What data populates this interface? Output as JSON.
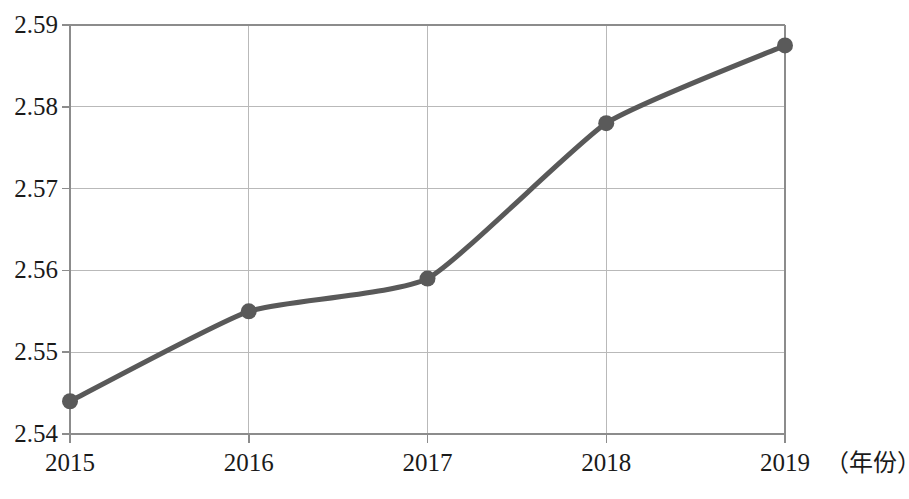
{
  "chart_data": {
    "type": "line",
    "title": "",
    "subtitle": "",
    "xlabel": "（年份）",
    "ylabel": "",
    "categories": [
      "2015",
      "2016",
      "2017",
      "2018",
      "2019"
    ],
    "x": [
      2015,
      2016,
      2017,
      2018,
      2019
    ],
    "values": [
      2.544,
      2.555,
      2.559,
      2.578,
      2.5875
    ],
    "series": [
      {
        "name": "",
        "values": [
          2.544,
          2.555,
          2.559,
          2.578,
          2.5875
        ]
      }
    ],
    "ylim": [
      2.54,
      2.59
    ],
    "xlim": [
      2015,
      2019
    ],
    "yticks": [
      2.54,
      2.55,
      2.56,
      2.57,
      2.58,
      2.59
    ],
    "ytick_labels": [
      "2.54",
      "2.55",
      "2.56",
      "2.57",
      "2.58",
      "2.59"
    ],
    "xticks": [
      2015,
      2016,
      2017,
      2018,
      2019
    ],
    "xtick_labels": [
      "2015",
      "2016",
      "2017",
      "2018",
      "2019"
    ],
    "grid": true,
    "grid_axes": "both",
    "legend": false,
    "legend_position": "none",
    "smoothing": "spline",
    "markers": "circle",
    "annotations": []
  },
  "style": {
    "line_color": "#595959",
    "marker_color": "#5a5a5a",
    "grid_color": "#b9b9b9",
    "axis_color": "#8c8c8c",
    "text_color": "#1a1a1a",
    "background": "#ffffff",
    "line_width": 5,
    "marker_radius": 8
  }
}
